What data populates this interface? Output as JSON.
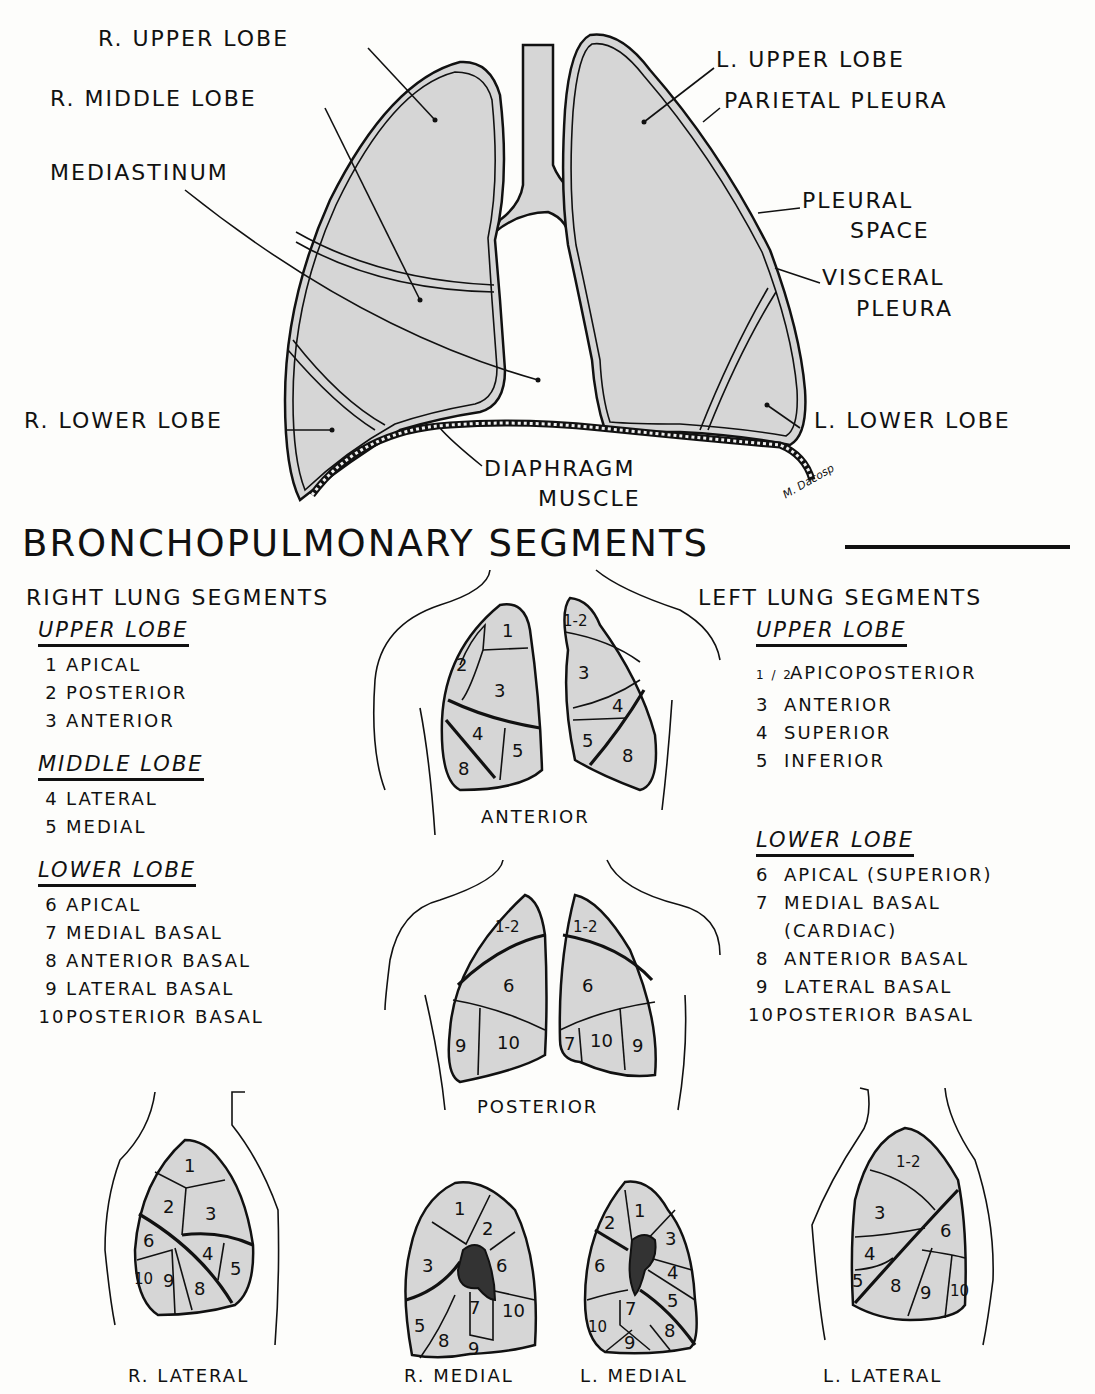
{
  "top_diagram": {
    "labels": {
      "r_upper_lobe": "R. UPPER LOBE",
      "r_middle_lobe": "R. MIDDLE LOBE",
      "mediastinum": "MEDIASTINUM",
      "r_lower_lobe": "R. LOWER LOBE",
      "l_upper_lobe": "L. UPPER LOBE",
      "parietal_pleura": "PARIETAL PLEURA",
      "pleural_space_1": "PLEURAL",
      "pleural_space_2": "SPACE",
      "visceral_pleura_1": "VISCERAL",
      "visceral_pleura_2": "PLEURA",
      "l_lower_lobe": "L. LOWER LOBE",
      "diaphragm_1": "DIAPHRAGM",
      "diaphragm_2": "MUSCLE"
    },
    "signature": "M. Dacosp"
  },
  "section_title": "BRONCHOPULMONARY SEGMENTS",
  "right_lung": {
    "heading": "RIGHT LUNG SEGMENTS",
    "groups": [
      {
        "title": "UPPER LOBE",
        "items": [
          {
            "num": "1",
            "name": "APICAL"
          },
          {
            "num": "2",
            "name": "POSTERIOR"
          },
          {
            "num": "3",
            "name": "ANTERIOR"
          }
        ]
      },
      {
        "title": "MIDDLE LOBE",
        "items": [
          {
            "num": "4",
            "name": "LATERAL"
          },
          {
            "num": "5",
            "name": "MEDIAL"
          }
        ]
      },
      {
        "title": "LOWER LOBE",
        "items": [
          {
            "num": "6",
            "name": "APICAL"
          },
          {
            "num": "7",
            "name": "MEDIAL BASAL"
          },
          {
            "num": "8",
            "name": "ANTERIOR BASAL"
          },
          {
            "num": "9",
            "name": "LATERAL BASAL"
          },
          {
            "num": "10",
            "name": "POSTERIOR BASAL"
          }
        ]
      }
    ]
  },
  "left_lung": {
    "heading": "LEFT LUNG SEGMENTS",
    "groups": [
      {
        "title": "UPPER LOBE",
        "items": [
          {
            "num": "1 / 2",
            "name": "APICOPOSTERIOR"
          },
          {
            "num": "3",
            "name": "ANTERIOR"
          },
          {
            "num": "4",
            "name": "SUPERIOR"
          },
          {
            "num": "5",
            "name": "INFERIOR"
          }
        ]
      },
      {
        "title": "LOWER LOBE",
        "items": [
          {
            "num": "6",
            "name": "APICAL (SUPERIOR)"
          },
          {
            "num": "7",
            "name": "MEDIAL BASAL"
          },
          {
            "num": "",
            "name": "(CARDIAC)"
          },
          {
            "num": "8",
            "name": "ANTERIOR BASAL"
          },
          {
            "num": "9",
            "name": "LATERAL BASAL"
          },
          {
            "num": "10",
            "name": "POSTERIOR BASAL"
          }
        ]
      }
    ]
  },
  "views": {
    "anterior": {
      "label": "ANTERIOR",
      "right": [
        "1",
        "2",
        "3",
        "4",
        "5",
        "8"
      ],
      "left": [
        "1-2",
        "3",
        "4",
        "5",
        "8"
      ]
    },
    "posterior": {
      "label": "POSTERIOR",
      "right": [
        "1-2",
        "6",
        "9",
        "10"
      ],
      "left": [
        "1-2",
        "6",
        "7",
        "10",
        "9"
      ]
    },
    "r_lateral": {
      "label": "R. LATERAL",
      "segments": [
        "1",
        "2",
        "3",
        "6",
        "4",
        "5",
        "10",
        "9",
        "8"
      ]
    },
    "r_medial": {
      "label": "R. MEDIAL",
      "segments": [
        "1",
        "2",
        "3",
        "6",
        "7",
        "10",
        "5",
        "8",
        "9"
      ]
    },
    "l_medial": {
      "label": "L. MEDIAL",
      "segments": [
        "2",
        "1",
        "3",
        "6",
        "4",
        "7",
        "5",
        "10",
        "8",
        "9"
      ]
    },
    "l_lateral": {
      "label": "L. LATERAL",
      "segments": [
        "1-2",
        "3",
        "6",
        "4",
        "5",
        "8",
        "9",
        "10"
      ]
    }
  },
  "colors": {
    "lung_fill": "#d6d6d6",
    "ink": "#111111",
    "paper": "#fdfdfb"
  }
}
